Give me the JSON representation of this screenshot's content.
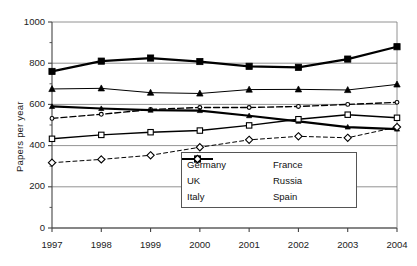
{
  "chart_data": {
    "type": "line",
    "title": "",
    "xlabel": "",
    "ylabel": "Papers per year",
    "categories": [
      "1997",
      "1998",
      "1999",
      "2000",
      "2001",
      "2002",
      "2003",
      "2004"
    ],
    "x": [
      1997,
      1998,
      1999,
      2000,
      2001,
      2002,
      2003,
      2004
    ],
    "xlim": [
      1997,
      2004
    ],
    "ylim": [
      0,
      1000
    ],
    "yticks": [
      0,
      200,
      400,
      600,
      800,
      1000
    ],
    "ytick_labels": [
      "0",
      "200",
      "400",
      "600",
      "800",
      "1000"
    ],
    "xtick_labels": [
      "1997",
      "1998",
      "1999",
      "2000",
      "2001",
      "2002",
      "2003",
      "2004"
    ],
    "grid": "horizontal",
    "legend_position": "inside-bottom-center",
    "series": [
      {
        "name": "Germany",
        "marker": "filled-square",
        "dash": "solid",
        "width": "thick",
        "color": "#000000",
        "values": [
          760,
          810,
          825,
          808,
          785,
          780,
          820,
          880
        ]
      },
      {
        "name": "France",
        "marker": "filled-triangle",
        "dash": "solid",
        "width": "thin",
        "color": "#000000",
        "values": [
          675,
          678,
          657,
          653,
          672,
          673,
          670,
          697
        ]
      },
      {
        "name": "UK",
        "marker": "open-circle-small",
        "dash": "dashed",
        "width": "medium",
        "color": "#000000",
        "values": [
          532,
          552,
          575,
          585,
          585,
          590,
          600,
          610
        ]
      },
      {
        "name": "Russia",
        "marker": "filled-triangle-small",
        "dash": "solid",
        "width": "thick",
        "color": "#000000",
        "values": [
          590,
          580,
          572,
          570,
          545,
          518,
          490,
          480
        ]
      },
      {
        "name": "Italy",
        "marker": "open-square",
        "dash": "solid",
        "width": "medium",
        "color": "#000000",
        "values": [
          433,
          452,
          465,
          473,
          498,
          528,
          550,
          535
        ]
      },
      {
        "name": "Spain",
        "marker": "open-diamond",
        "dash": "dashed",
        "width": "thin",
        "color": "#000000",
        "values": [
          317,
          333,
          353,
          392,
          428,
          445,
          438,
          490
        ]
      }
    ]
  },
  "legend": {
    "entries": [
      {
        "label": "Germany"
      },
      {
        "label": "France"
      },
      {
        "label": "UK"
      },
      {
        "label": "Russia"
      },
      {
        "label": "Italy"
      },
      {
        "label": "Spain"
      }
    ]
  },
  "colors": {
    "axis": "#444444",
    "grid": "#777777",
    "series": "#000000",
    "background": "#ffffff"
  }
}
